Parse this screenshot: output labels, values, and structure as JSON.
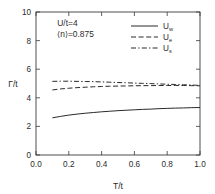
{
  "chart_data": {
    "type": "line",
    "title": "",
    "xlabel": "T/t",
    "ylabel": "Γ/t",
    "xlim": [
      0.0,
      1.0
    ],
    "ylim": [
      0,
      10
    ],
    "grid": false,
    "legend_position": "upper-right",
    "xticks": [
      "0.0",
      "0.2",
      "0.4",
      "0.6",
      "0.8",
      "1.0"
    ],
    "xtick_values": [
      0.0,
      0.2,
      0.4,
      0.6,
      0.8,
      1.0
    ],
    "yticks": [
      "0",
      "2",
      "4",
      "6",
      "8",
      "10"
    ],
    "ytick_values": [
      0,
      2,
      4,
      6,
      8,
      10
    ],
    "annotations": [
      {
        "text": "U/t=4",
        "x": 0.13,
        "y": 9.05
      },
      {
        "text": "⟨n⟩=0.875",
        "x": 0.13,
        "y": 8.25
      }
    ],
    "series": [
      {
        "name": "U_w",
        "label_base": "U",
        "label_sub": "w",
        "style": "solid",
        "dasharray": "",
        "x": [
          0.1,
          0.15,
          0.2,
          0.25,
          0.3,
          0.35,
          0.4,
          0.45,
          0.5,
          0.55,
          0.6,
          0.65,
          0.7,
          0.75,
          0.8,
          0.85,
          0.9,
          0.95,
          1.0
        ],
        "values": [
          2.6,
          2.7,
          2.79,
          2.86,
          2.92,
          2.97,
          3.02,
          3.06,
          3.1,
          3.13,
          3.16,
          3.19,
          3.21,
          3.24,
          3.26,
          3.28,
          3.29,
          3.31,
          3.32
        ]
      },
      {
        "name": "U_e",
        "label_base": "U",
        "label_sub": "e",
        "style": "dashed",
        "dasharray": "5,2.6",
        "x": [
          0.1,
          0.15,
          0.2,
          0.25,
          0.3,
          0.35,
          0.4,
          0.45,
          0.5,
          0.55,
          0.6,
          0.65,
          0.7,
          0.75,
          0.8,
          0.85,
          0.9,
          0.95,
          1.0
        ],
        "values": [
          4.55,
          4.62,
          4.67,
          4.71,
          4.74,
          4.77,
          4.79,
          4.81,
          4.82,
          4.83,
          4.84,
          4.85,
          4.85,
          4.86,
          4.86,
          4.86,
          4.86,
          4.85,
          4.84
        ]
      },
      {
        "name": "U_s",
        "label_base": "U",
        "label_sub": "s",
        "style": "dashdot",
        "dasharray": "5,2.2,1.4,2.2",
        "x": [
          0.1,
          0.15,
          0.2,
          0.25,
          0.3,
          0.35,
          0.4,
          0.45,
          0.5,
          0.55,
          0.6,
          0.65,
          0.7,
          0.75,
          0.8,
          0.85,
          0.9,
          0.95,
          1.0
        ],
        "values": [
          5.15,
          5.16,
          5.16,
          5.15,
          5.14,
          5.13,
          5.11,
          5.09,
          5.07,
          5.05,
          5.03,
          5.01,
          4.99,
          4.97,
          4.95,
          4.93,
          4.91,
          4.89,
          4.87
        ]
      }
    ]
  },
  "legend": {
    "entries": [
      {
        "base": "U",
        "sub": "w",
        "style": "solid"
      },
      {
        "base": "U",
        "sub": "e",
        "style": "dashed"
      },
      {
        "base": "U",
        "sub": "s",
        "style": "dashdot"
      }
    ]
  },
  "colors": {
    "background": "#ffffff",
    "ink": "#2a2a2a",
    "axis": "#3a3a3a"
  }
}
